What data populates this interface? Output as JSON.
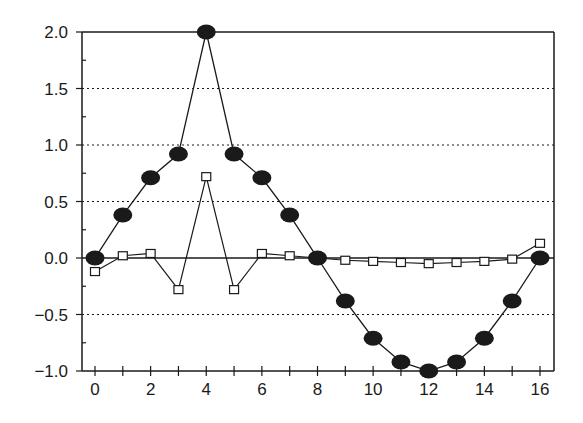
{
  "chart_data": {
    "type": "line",
    "title": "",
    "xlabel": "",
    "ylabel": "",
    "x": [
      0,
      1,
      2,
      3,
      4,
      5,
      6,
      7,
      8,
      9,
      10,
      11,
      12,
      13,
      14,
      15,
      16
    ],
    "xlim": [
      -0.5,
      16.5
    ],
    "ylim": [
      -1.0,
      2.0
    ],
    "x_ticks": [
      0,
      2,
      4,
      6,
      8,
      10,
      12,
      14,
      16
    ],
    "x_tick_labels": [
      "0",
      "2",
      "4",
      "6",
      "8",
      "10",
      "12",
      "14",
      "16"
    ],
    "y_ticks": [
      2.0,
      1.5,
      1.0,
      0.5,
      0.0,
      -0.5,
      -1.0
    ],
    "y_tick_labels": [
      "2.0",
      "1.5",
      "1.0",
      "0.5",
      "0.0",
      "−0.5",
      "−1.0"
    ],
    "grid": "horizontal dotted at 0.5 intervals",
    "legend": "none",
    "series": [
      {
        "name": "filled-circles",
        "marker": "filled-ellipse",
        "values": [
          0,
          0.38,
          0.71,
          0.92,
          2.0,
          0.92,
          0.71,
          0.38,
          0,
          -0.38,
          -0.71,
          -0.92,
          -1.0,
          -0.92,
          -0.71,
          -0.38,
          0
        ]
      },
      {
        "name": "open-squares",
        "marker": "open-square",
        "values": [
          -0.12,
          0.02,
          0.04,
          -0.28,
          0.72,
          -0.28,
          0.04,
          0.02,
          0,
          -0.02,
          -0.03,
          -0.04,
          -0.05,
          -0.04,
          -0.03,
          -0.01,
          0.13
        ]
      }
    ]
  },
  "colors": {
    "ink": "#1a1a1a",
    "background": "#ffffff"
  }
}
